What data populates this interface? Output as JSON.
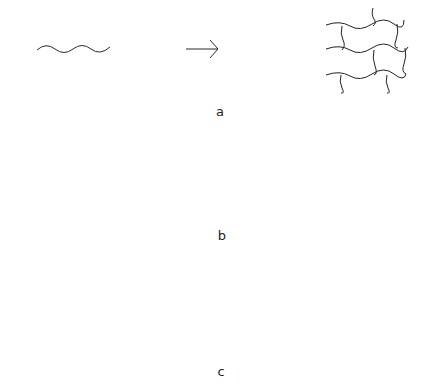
{
  "diagram": {
    "type": "polymer network formation schematic",
    "colors": {
      "line": "#2a2a2a",
      "node_filled": "#111111",
      "node_open_fill": "#ffffff",
      "background": "#ffffff"
    },
    "rows": [
      {
        "label": "a",
        "steps": [
          "linear chain",
          "arrow",
          "crosslinked network"
        ]
      },
      {
        "label": "b",
        "steps": [
          "4-arm star with open end groups",
          "plus",
          "linear difunctional linker",
          "arrow",
          "network with filled junction nodes"
        ]
      },
      {
        "label": "c",
        "steps": [
          "4-arm star with open end groups",
          "arrow",
          "dense crosslinked cluster",
          "arrow",
          "clustered network of aggregates"
        ]
      }
    ],
    "symbols": {
      "plus": "+",
      "arrow": "→"
    }
  }
}
